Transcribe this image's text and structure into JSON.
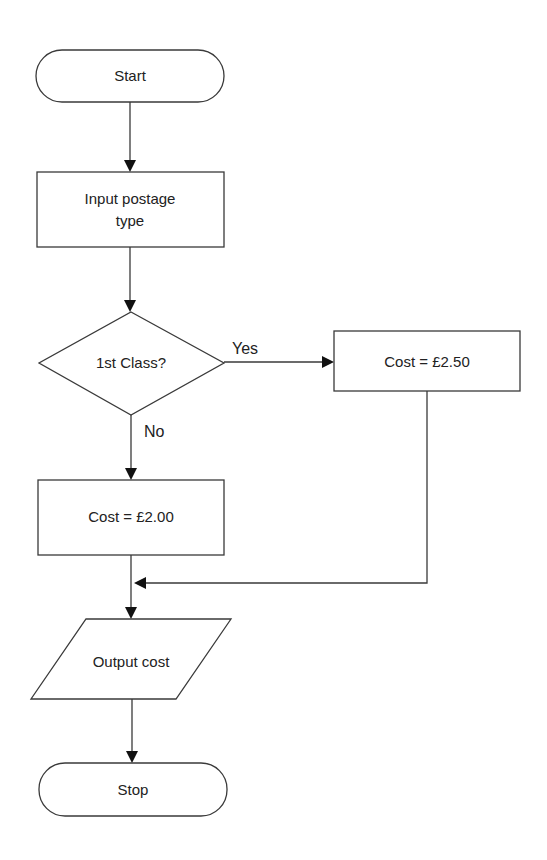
{
  "diagram": {
    "type": "flowchart",
    "nodes": {
      "start": {
        "shape": "terminator",
        "label": "Start"
      },
      "input": {
        "shape": "process",
        "label_line1": "Input postage",
        "label_line2": "type"
      },
      "decision": {
        "shape": "decision",
        "label": "1st Class?"
      },
      "cost_first": {
        "shape": "process",
        "label": "Cost = £2.50"
      },
      "cost_second": {
        "shape": "process",
        "label": "Cost = £2.00"
      },
      "output": {
        "shape": "input-output",
        "label": "Output cost"
      },
      "stop": {
        "shape": "terminator",
        "label": "Stop"
      }
    },
    "edges": [
      {
        "from": "start",
        "to": "input",
        "label": ""
      },
      {
        "from": "input",
        "to": "decision",
        "label": ""
      },
      {
        "from": "decision",
        "to": "cost_first",
        "label": "Yes"
      },
      {
        "from": "decision",
        "to": "cost_second",
        "label": "No"
      },
      {
        "from": "cost_first",
        "to": "output",
        "label": ""
      },
      {
        "from": "cost_second",
        "to": "output",
        "label": ""
      },
      {
        "from": "output",
        "to": "stop",
        "label": ""
      }
    ],
    "edge_labels": {
      "yes": "Yes",
      "no": "No"
    },
    "colors": {
      "stroke": "#3a3a3a",
      "fill": "#ffffff",
      "text": "#222222"
    }
  }
}
